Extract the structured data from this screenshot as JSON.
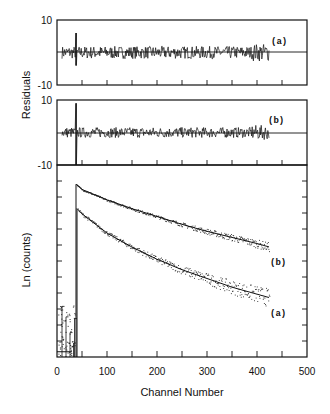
{
  "chart_data": [
    {
      "panel": "residuals-a",
      "type": "line",
      "title": "",
      "curve_label": "(a)",
      "xlabel": "",
      "ylabel": "Residuals",
      "ylim": [
        -10,
        10
      ],
      "yticks": [
        "10",
        "-10"
      ],
      "xlim": [
        0,
        500
      ],
      "x_range_of_data": [
        10,
        425
      ],
      "spike_channel": 38,
      "spike_range": [
        -4,
        6
      ],
      "noise_amplitude": 1.2,
      "baseline": 0,
      "grid": false
    },
    {
      "panel": "residuals-b",
      "type": "line",
      "curve_label": "(b)",
      "ylabel": "Residuals",
      "ylim": [
        -10,
        10
      ],
      "yticks": [
        "10",
        "-10"
      ],
      "xlim": [
        0,
        500
      ],
      "x_range_of_data": [
        10,
        425
      ],
      "spike_channel": 38,
      "spike_range": [
        -10,
        9
      ],
      "noise_amplitude": 1.0,
      "baseline": 0,
      "grid": false
    },
    {
      "panel": "decay",
      "type": "scatter",
      "title": "",
      "xlabel": "Channel Number",
      "ylabel": "Ln (counts)",
      "xlim": [
        0,
        500
      ],
      "xticks": [
        0,
        100,
        200,
        300,
        400,
        500
      ],
      "x_minor_ticks": [
        50,
        150,
        250,
        350,
        450
      ],
      "ylim": [
        0,
        11
      ],
      "y_ticks_count": 11,
      "y_tick_labels": [],
      "legend": "none",
      "grid": false,
      "series": [
        {
          "name": "(b)",
          "peak_channel": 38,
          "peak_value": 9.9,
          "end_channel": 425,
          "end_value": 6.3,
          "x": [
            38,
            50,
            100,
            150,
            200,
            250,
            300,
            350,
            400,
            425
          ],
          "values": [
            9.9,
            9.6,
            9.0,
            8.5,
            8.05,
            7.6,
            7.2,
            6.85,
            6.5,
            6.3
          ]
        },
        {
          "name": "(a)",
          "peak_channel": 40,
          "peak_value": 8.5,
          "end_channel": 425,
          "end_value": 3.4,
          "x": [
            40,
            50,
            100,
            150,
            200,
            250,
            300,
            350,
            400,
            425
          ],
          "values": [
            8.5,
            8.2,
            7.1,
            6.3,
            5.6,
            5.0,
            4.5,
            4.0,
            3.6,
            3.4
          ]
        }
      ]
    }
  ],
  "labels": {
    "residuals_axis": "Residuals",
    "ln_axis": "Ln (counts)",
    "x_axis": "Channel Number",
    "panel_a": "(a)",
    "panel_b": "(b)",
    "decay_a": "(a)",
    "decay_b": "(b)",
    "res_top_a": "10",
    "res_bottom_a": "-10",
    "res_top_b": "10",
    "res_bottom_b": "-10",
    "x_ticks": [
      "0",
      "100",
      "200",
      "300",
      "400",
      "500"
    ]
  }
}
